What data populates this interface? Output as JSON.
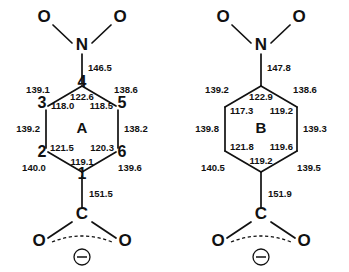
{
  "figure": {
    "background_color": "#ffffff",
    "line_color": "#111111",
    "structures": [
      {
        "id": "A",
        "label": "A",
        "numbered_vertices": true,
        "atoms": {
          "nitro_o_left": "O",
          "nitro_o_right": "O",
          "nitrogen": "N",
          "carboxyl_c": "C",
          "carboxyl_o_left": "O",
          "carboxyl_o_right": "O",
          "charge": "⊖"
        },
        "ring_numbers": {
          "c1": "1",
          "c2": "2",
          "c3": "3",
          "c4": "4",
          "c5": "5",
          "c6": "6"
        },
        "bond_lengths": {
          "c4_n": "146.5",
          "c3_c4": "139.1",
          "c4_c5": "138.6",
          "c2_c3": "139.2",
          "c5_c6": "138.2",
          "c1_c2": "140.0",
          "c1_c6": "139.6",
          "c1_c_carboxyl": "151.5"
        },
        "bond_angles": {
          "c3_c4_c5": "122.6",
          "c4_c3_c2": "118.0",
          "c4_c5_c6": "118.5",
          "c3_c2_c1": "121.5",
          "c5_c6_c1": "120.3",
          "c2_c1_c6": "119.1"
        }
      },
      {
        "id": "B",
        "label": "B",
        "numbered_vertices": false,
        "atoms": {
          "nitro_o_left": "O",
          "nitro_o_right": "O",
          "nitrogen": "N",
          "carboxyl_c": "C",
          "carboxyl_o_left": "O",
          "carboxyl_o_right": "O",
          "charge": "⊖"
        },
        "bond_lengths": {
          "c4_n": "147.8",
          "c3_c4": "139.2",
          "c4_c5": "138.6",
          "c2_c3": "139.8",
          "c5_c6": "139.3",
          "c1_c2": "140.5",
          "c1_c6": "139.5",
          "c1_c_carboxyl": "151.9"
        },
        "bond_angles": {
          "c3_c4_c5": "122.9",
          "c4_c3_c2": "117.3",
          "c4_c5_c6": "119.2",
          "c3_c2_c1": "121.8",
          "c5_c6_c1": "119.6",
          "c2_c1_c6": "119.2"
        }
      }
    ]
  }
}
